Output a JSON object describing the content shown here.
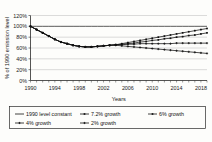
{
  "chart_data": {
    "type": "line",
    "title": "",
    "xlabel": "Years",
    "ylabel": "% of 1990 emission level",
    "xlim": [
      1990,
      2019
    ],
    "ylim": [
      0,
      120
    ],
    "ytick_labels": [
      "0%",
      "20%",
      "40%",
      "60%",
      "80%",
      "100%",
      "120%"
    ],
    "ytick_values": [
      0,
      20,
      40,
      60,
      80,
      100,
      120
    ],
    "xtick_labels": [
      "1990",
      "1994",
      "1998",
      "2002",
      "2006",
      "2010",
      "2014",
      "2018"
    ],
    "xtick_values": [
      1990,
      1994,
      1998,
      2002,
      2006,
      2010,
      2014,
      2018
    ],
    "grid": true,
    "legend_position": "below",
    "x": [
      1990,
      1991,
      1992,
      1993,
      1994,
      1995,
      1996,
      1997,
      1998,
      1999,
      2000,
      2001,
      2002,
      2003,
      2004,
      2005,
      2006,
      2007,
      2008,
      2009,
      2010,
      2011,
      2012,
      2013,
      2014,
      2015,
      2016,
      2017,
      2018,
      2019
    ],
    "series": [
      {
        "name": "1990 level constant",
        "marker": "none",
        "values": [
          100,
          100,
          100,
          100,
          100,
          100,
          100,
          100,
          100,
          100,
          100,
          100,
          100,
          100,
          100,
          100,
          100,
          100,
          100,
          100,
          100,
          100,
          100,
          100,
          100,
          100,
          100,
          100,
          100,
          100
        ]
      },
      {
        "name": "7.2% growth",
        "marker": "square",
        "values": [
          100,
          94,
          88,
          82,
          76,
          71,
          68,
          65,
          63,
          62,
          62,
          63,
          64,
          65,
          66,
          68,
          70,
          72,
          74,
          76,
          78,
          80,
          82,
          84,
          86,
          88,
          90,
          92,
          94,
          96
        ]
      },
      {
        "name": "6% growth",
        "marker": "square",
        "values": [
          100,
          94,
          88,
          82,
          76,
          71,
          68,
          65,
          63,
          62,
          62,
          63,
          64,
          65,
          66,
          67,
          68,
          69,
          71,
          72,
          74,
          75,
          77,
          78,
          80,
          81,
          83,
          84,
          86,
          88
        ]
      },
      {
        "name": "4% growth",
        "marker": "cross",
        "values": [
          100,
          94,
          88,
          82,
          76,
          71,
          68,
          65,
          63,
          62,
          62,
          63,
          64,
          65,
          66,
          66,
          67,
          67,
          68,
          68,
          68,
          68,
          68,
          68,
          69,
          69,
          69,
          69,
          69,
          69
        ]
      },
      {
        "name": "2% growth",
        "marker": "cross",
        "values": [
          100,
          94,
          88,
          82,
          76,
          71,
          68,
          65,
          63,
          62,
          62,
          63,
          64,
          65,
          65,
          64,
          63,
          62,
          61,
          60,
          59,
          58,
          57,
          56,
          55,
          54,
          53,
          52,
          51,
          50
        ]
      }
    ]
  },
  "legend": {
    "entries": [
      {
        "label": "1990 level constant"
      },
      {
        "label": "7.2% growth"
      },
      {
        "label": "6% growth"
      },
      {
        "label": "4% growth"
      },
      {
        "label": "2% growth"
      }
    ]
  }
}
